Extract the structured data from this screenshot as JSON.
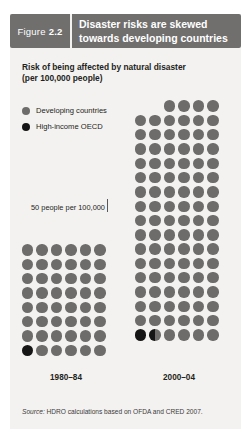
{
  "figure": {
    "tag_word": "Figure",
    "tag_number": "2.2",
    "title_line1": "Disaster risks are skewed",
    "title_line2": "towards developing countries",
    "subtitle_line1": "Risk of being affected by natural disaster",
    "subtitle_line2": "(per 100,000 people)",
    "annotation": "50 people per 100,000",
    "source_word": "Source:",
    "source_text": "HDRO calculations based on OFDA and CRED 2007.",
    "header_bg": "#706f6e",
    "panel_bg": "#f3f2f0"
  },
  "legend": {
    "items": [
      {
        "label": "Developing countries",
        "color": "#6d6c6b",
        "key": "developing"
      },
      {
        "label": "High-income OECD",
        "color": "#151515",
        "key": "oecd"
      }
    ]
  },
  "chart_data": {
    "type": "bar",
    "subtype": "pictogram-dot-plot",
    "title": "Disaster risks are skewed towards developing countries",
    "subtitle": "Risk of being affected by natural disaster (per 100,000 people)",
    "xlabel": "",
    "ylabel": "People affected per 100,000",
    "unit_per_dot": 50,
    "unit_annotation": "50 people per 100,000",
    "dots_per_row": 6,
    "categories": [
      "1980–84",
      "2000–04"
    ],
    "series": [
      {
        "name": "Developing countries",
        "color": "#6d6c6b",
        "values": [
          2350,
          4975
        ]
      },
      {
        "name": "High-income OECD",
        "color": "#151515",
        "values": [
          50,
          75
        ]
      }
    ],
    "dot_counts": [
      {
        "category": "1980–84",
        "developing_dots": 47,
        "oecd_dots": 1,
        "total_dots": 48,
        "rows": 8
      },
      {
        "category": "2000–04",
        "developing_dots": 98.5,
        "oecd_dots": 1.5,
        "total_dots": 100,
        "rows": 17
      }
    ],
    "grid": false,
    "legend_position": "top-left"
  },
  "groups": [
    {
      "id": "1980",
      "label": "1980–84",
      "rows": [
        [
          "g",
          "g",
          "g",
          "g",
          "g",
          "g"
        ],
        [
          "g",
          "g",
          "g",
          "g",
          "g",
          "g"
        ],
        [
          "g",
          "g",
          "g",
          "g",
          "g",
          "g"
        ],
        [
          "g",
          "g",
          "g",
          "g",
          "g",
          "g"
        ],
        [
          "g",
          "g",
          "g",
          "g",
          "g",
          "g"
        ],
        [
          "g",
          "g",
          "g",
          "g",
          "g",
          "g"
        ],
        [
          "g",
          "g",
          "g",
          "g",
          "g",
          "g"
        ],
        [
          "b",
          "g",
          "g",
          "g",
          "g",
          "g"
        ]
      ]
    },
    {
      "id": "2000",
      "label": "2000–04",
      "rows": [
        [
          "n",
          "n",
          "g",
          "g",
          "g",
          "g"
        ],
        [
          "g",
          "g",
          "g",
          "g",
          "g",
          "g"
        ],
        [
          "g",
          "g",
          "g",
          "g",
          "g",
          "g"
        ],
        [
          "g",
          "g",
          "g",
          "g",
          "g",
          "g"
        ],
        [
          "g",
          "g",
          "g",
          "g",
          "g",
          "g"
        ],
        [
          "g",
          "g",
          "g",
          "g",
          "g",
          "g"
        ],
        [
          "g",
          "g",
          "g",
          "g",
          "g",
          "g"
        ],
        [
          "g",
          "g",
          "g",
          "g",
          "g",
          "g"
        ],
        [
          "g",
          "g",
          "g",
          "g",
          "g",
          "g"
        ],
        [
          "g",
          "g",
          "g",
          "g",
          "g",
          "g"
        ],
        [
          "g",
          "g",
          "g",
          "g",
          "g",
          "g"
        ],
        [
          "g",
          "g",
          "g",
          "g",
          "g",
          "g"
        ],
        [
          "g",
          "g",
          "g",
          "g",
          "g",
          "g"
        ],
        [
          "g",
          "g",
          "g",
          "g",
          "g",
          "g"
        ],
        [
          "g",
          "g",
          "g",
          "g",
          "g",
          "g"
        ],
        [
          "g",
          "g",
          "g",
          "g",
          "g",
          "g"
        ],
        [
          "b",
          "h",
          "g",
          "g",
          "g",
          "g"
        ]
      ]
    }
  ]
}
